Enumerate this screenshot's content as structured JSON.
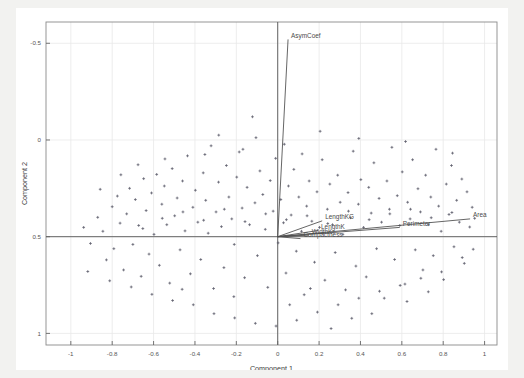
{
  "figure": {
    "background_color": "#f2f2f0",
    "plot_background_color": "#ffffff",
    "grid_color": "#e8e8e8",
    "axis_color": "#555555",
    "point_color": "#5a5a68",
    "vector_color": "#4a4a4a"
  },
  "axes": {
    "xlabel": "Component 1",
    "ylabel": "Component 2",
    "xticks": [
      "-1",
      "-0.8",
      "-0.6",
      "-0.4",
      "-0.2",
      "0",
      "0.2",
      "0.4",
      "0.6",
      "0.8",
      "1"
    ],
    "yticks": [
      "1",
      "0.5",
      "0",
      "-0.5"
    ]
  },
  "chart_data": {
    "type": "scatter",
    "title": "",
    "xlabel": "Component 1",
    "ylabel": "Component 2",
    "xlim": [
      -1.12,
      1.06
    ],
    "ylim": [
      -0.56,
      1.11
    ],
    "xticks": [
      -1,
      -0.8,
      -0.6,
      -0.4,
      -0.2,
      0,
      0.2,
      0.4,
      0.6,
      0.8,
      1
    ],
    "yticks": [
      -0.5,
      0,
      0.5,
      1
    ],
    "grid": true,
    "legend": "none",
    "annotations": [
      "AsymCoef",
      "LengthKG",
      "LengthK",
      "Compactness",
      "WidthK",
      "Perimeter",
      "Area"
    ],
    "loading_vectors": [
      {
        "label": "AsymCoef",
        "x": 0.05,
        "y": 1.02
      },
      {
        "label": "LengthKG",
        "x": 0.215,
        "y": 0.082
      },
      {
        "label": "LengthK",
        "x": 0.195,
        "y": 0.032
      },
      {
        "label": "WidthK",
        "x": 0.15,
        "y": 0.008
      },
      {
        "label": "Compactness",
        "x": 0.11,
        "y": -0.01
      },
      {
        "label": "Perimeter",
        "x": 0.59,
        "y": 0.048
      },
      {
        "label": "Area",
        "x": 0.93,
        "y": 0.092
      }
    ],
    "points": [
      [
        -0.905,
        -0.035
      ],
      [
        -0.87,
        0.1
      ],
      [
        -0.845,
        0.028
      ],
      [
        -0.828,
        -0.12
      ],
      [
        -0.8,
        0.155
      ],
      [
        -0.792,
        -0.062
      ],
      [
        -0.775,
        0.21
      ],
      [
        -0.762,
        0.07
      ],
      [
        -0.745,
        -0.172
      ],
      [
        -0.73,
        0.118
      ],
      [
        -0.716,
        0.25
      ],
      [
        -0.7,
        -0.04
      ],
      [
        -0.688,
        0.192
      ],
      [
        -0.672,
        0.058
      ],
      [
        -0.66,
        -0.205
      ],
      [
        -0.648,
        0.3
      ],
      [
        -0.636,
        0.135
      ],
      [
        -0.622,
        -0.09
      ],
      [
        -0.61,
        0.226
      ],
      [
        -0.598,
        0.012
      ],
      [
        -0.585,
        0.322
      ],
      [
        -0.572,
        -0.148
      ],
      [
        -0.56,
        0.168
      ],
      [
        -0.548,
        0.262
      ],
      [
        -0.536,
        0.062
      ],
      [
        -0.522,
        -0.24
      ],
      [
        -0.51,
        0.352
      ],
      [
        -0.498,
        0.108
      ],
      [
        -0.486,
        0.2
      ],
      [
        -0.472,
        -0.068
      ],
      [
        -0.46,
        0.288
      ],
      [
        -0.448,
        0.03
      ],
      [
        -0.436,
        0.418
      ],
      [
        -0.422,
        -0.192
      ],
      [
        -0.41,
        0.152
      ],
      [
        -0.398,
        0.24
      ],
      [
        -0.386,
        0.075
      ],
      [
        -0.372,
        -0.118
      ],
      [
        -0.36,
        0.33
      ],
      [
        -0.348,
        0.188
      ],
      [
        -0.336,
        0.018
      ],
      [
        -0.322,
        0.47
      ],
      [
        -0.31,
        -0.268
      ],
      [
        -0.298,
        0.128
      ],
      [
        -0.286,
        0.282
      ],
      [
        -0.272,
        0.052
      ],
      [
        -0.26,
        -0.16
      ],
      [
        -0.248,
        0.368
      ],
      [
        -0.236,
        0.205
      ],
      [
        -0.222,
        0.092
      ],
      [
        -0.21,
        -0.04
      ],
      [
        -0.198,
        0.308
      ],
      [
        -0.186,
        0.438
      ],
      [
        -0.172,
        0.148
      ],
      [
        -0.16,
        -0.212
      ],
      [
        -0.148,
        0.255
      ],
      [
        -0.136,
        0.062
      ],
      [
        -0.122,
        0.62
      ],
      [
        -0.11,
        0.175
      ],
      [
        -0.098,
        -0.098
      ],
      [
        -0.086,
        0.34
      ],
      [
        -0.072,
        0.218
      ],
      [
        -0.06,
        0.038
      ],
      [
        -0.048,
        -0.262
      ],
      [
        -0.036,
        0.29
      ],
      [
        -0.022,
        0.132
      ],
      [
        -0.01,
        0.405
      ],
      [
        0.002,
        -0.032
      ],
      [
        0.015,
        0.192
      ],
      [
        0.028,
        0.072
      ],
      [
        0.04,
        -0.188
      ],
      [
        0.052,
        0.262
      ],
      [
        0.065,
        0.112
      ],
      [
        0.078,
        0.348
      ],
      [
        0.09,
        -0.075
      ],
      [
        0.102,
        0.205
      ],
      [
        0.115,
        0.028
      ],
      [
        0.128,
        -0.3
      ],
      [
        0.14,
        0.158
      ],
      [
        0.152,
        0.288
      ],
      [
        0.165,
        0.08
      ],
      [
        0.178,
        -0.132
      ],
      [
        0.19,
        0.232
      ],
      [
        0.202,
        0.048
      ],
      [
        0.215,
        0.398
      ],
      [
        0.228,
        -0.225
      ],
      [
        0.24,
        0.142
      ],
      [
        0.252,
        0.272
      ],
      [
        0.265,
        0.062
      ],
      [
        0.278,
        -0.082
      ],
      [
        0.29,
        0.318
      ],
      [
        0.302,
        0.178
      ],
      [
        0.315,
        0.012
      ],
      [
        0.328,
        -0.275
      ],
      [
        0.34,
        0.228
      ],
      [
        0.352,
        0.098
      ],
      [
        0.365,
        0.442
      ],
      [
        0.378,
        -0.152
      ],
      [
        0.39,
        0.168
      ],
      [
        0.402,
        0.295
      ],
      [
        0.415,
        0.048
      ],
      [
        0.428,
        -0.208
      ],
      [
        0.44,
        0.255
      ],
      [
        0.452,
        0.122
      ],
      [
        0.465,
        0.382
      ],
      [
        0.478,
        -0.062
      ],
      [
        0.49,
        0.198
      ],
      [
        0.502,
        0.075
      ],
      [
        0.515,
        -0.318
      ],
      [
        0.528,
        0.288
      ],
      [
        0.54,
        0.142
      ],
      [
        0.552,
        0.462
      ],
      [
        0.565,
        -0.118
      ],
      [
        0.578,
        0.212
      ],
      [
        0.59,
        0.058
      ],
      [
        0.602,
        0.335
      ],
      [
        0.615,
        -0.245
      ],
      [
        0.628,
        0.178
      ],
      [
        0.64,
        0.092
      ],
      [
        0.652,
        0.398
      ],
      [
        0.665,
        -0.068
      ],
      [
        0.678,
        0.248
      ],
      [
        0.69,
        0.128
      ],
      [
        0.702,
        -0.172
      ],
      [
        0.715,
        0.318
      ],
      [
        0.728,
        0.062
      ],
      [
        0.74,
        0.205
      ],
      [
        0.752,
        -0.098
      ],
      [
        0.765,
        0.452
      ],
      [
        0.778,
        0.158
      ],
      [
        0.79,
        0.028
      ],
      [
        0.802,
        -0.222
      ],
      [
        0.815,
        0.272
      ],
      [
        0.828,
        0.115
      ],
      [
        0.84,
        0.368
      ],
      [
        0.852,
        -0.052
      ],
      [
        0.865,
        0.188
      ],
      [
        0.878,
        0.075
      ],
      [
        0.89,
        0.298
      ],
      [
        0.902,
        -0.138
      ],
      [
        0.915,
        0.232
      ],
      [
        0.928,
        0.05
      ],
      [
        0.94,
        0.152
      ],
      [
        0.952,
        0.095
      ],
      [
        -0.938,
        0.048
      ],
      [
        -0.918,
        -0.18
      ],
      [
        -0.858,
        0.245
      ],
      [
        -0.812,
        -0.228
      ],
      [
        -0.758,
        0.32
      ],
      [
        -0.708,
        -0.26
      ],
      [
        -0.652,
        0.042
      ],
      [
        -0.608,
        -0.298
      ],
      [
        -0.558,
        0.095
      ],
      [
        -0.508,
        -0.33
      ],
      [
        -0.458,
        0.128
      ],
      [
        -0.408,
        -0.352
      ],
      [
        -0.358,
        0.085
      ],
      [
        -0.308,
        -0.398
      ],
      [
        -0.258,
        0.142
      ],
      [
        -0.208,
        -0.42
      ],
      [
        -0.158,
        0.078
      ],
      [
        -0.108,
        -0.448
      ],
      [
        -0.058,
        0.118
      ],
      [
        -0.008,
        -0.462
      ],
      [
        0.042,
        0.088
      ],
      [
        0.092,
        -0.432
      ],
      [
        0.142,
        0.108
      ],
      [
        0.192,
        -0.39
      ],
      [
        0.242,
        0.068
      ],
      [
        0.292,
        -0.352
      ],
      [
        0.342,
        0.132
      ],
      [
        0.392,
        -0.318
      ],
      [
        0.442,
        0.088
      ],
      [
        0.492,
        -0.282
      ],
      [
        0.542,
        0.118
      ],
      [
        0.592,
        -0.252
      ],
      [
        0.642,
        0.142
      ],
      [
        0.692,
        -0.215
      ],
      [
        0.742,
        0.098
      ],
      [
        0.792,
        -0.182
      ],
      [
        0.842,
        0.125
      ],
      [
        0.892,
        -0.108
      ],
      [
        -0.285,
        0.525
      ],
      [
        -0.105,
        0.512
      ],
      [
        0.032,
        0.478
      ],
      [
        0.205,
        0.545
      ],
      [
        0.392,
        0.508
      ],
      [
        0.618,
        0.492
      ],
      [
        0.845,
        0.432
      ],
      [
        -0.352,
        0.425
      ],
      [
        -0.168,
        0.452
      ],
      [
        0.118,
        0.428
      ],
      [
        -0.212,
        -0.31
      ],
      [
        0.158,
        -0.268
      ],
      [
        0.358,
        -0.422
      ],
      [
        -0.462,
        -0.272
      ],
      [
        0.058,
        -0.352
      ],
      [
        0.258,
        -0.475
      ],
      [
        0.625,
        -0.335
      ],
      [
        0.455,
        -0.398
      ],
      [
        -0.675,
        0.372
      ],
      [
        -0.545,
        0.402
      ],
      [
        0.728,
        -0.285
      ],
      [
        0.945,
        -0.065
      ]
    ]
  }
}
